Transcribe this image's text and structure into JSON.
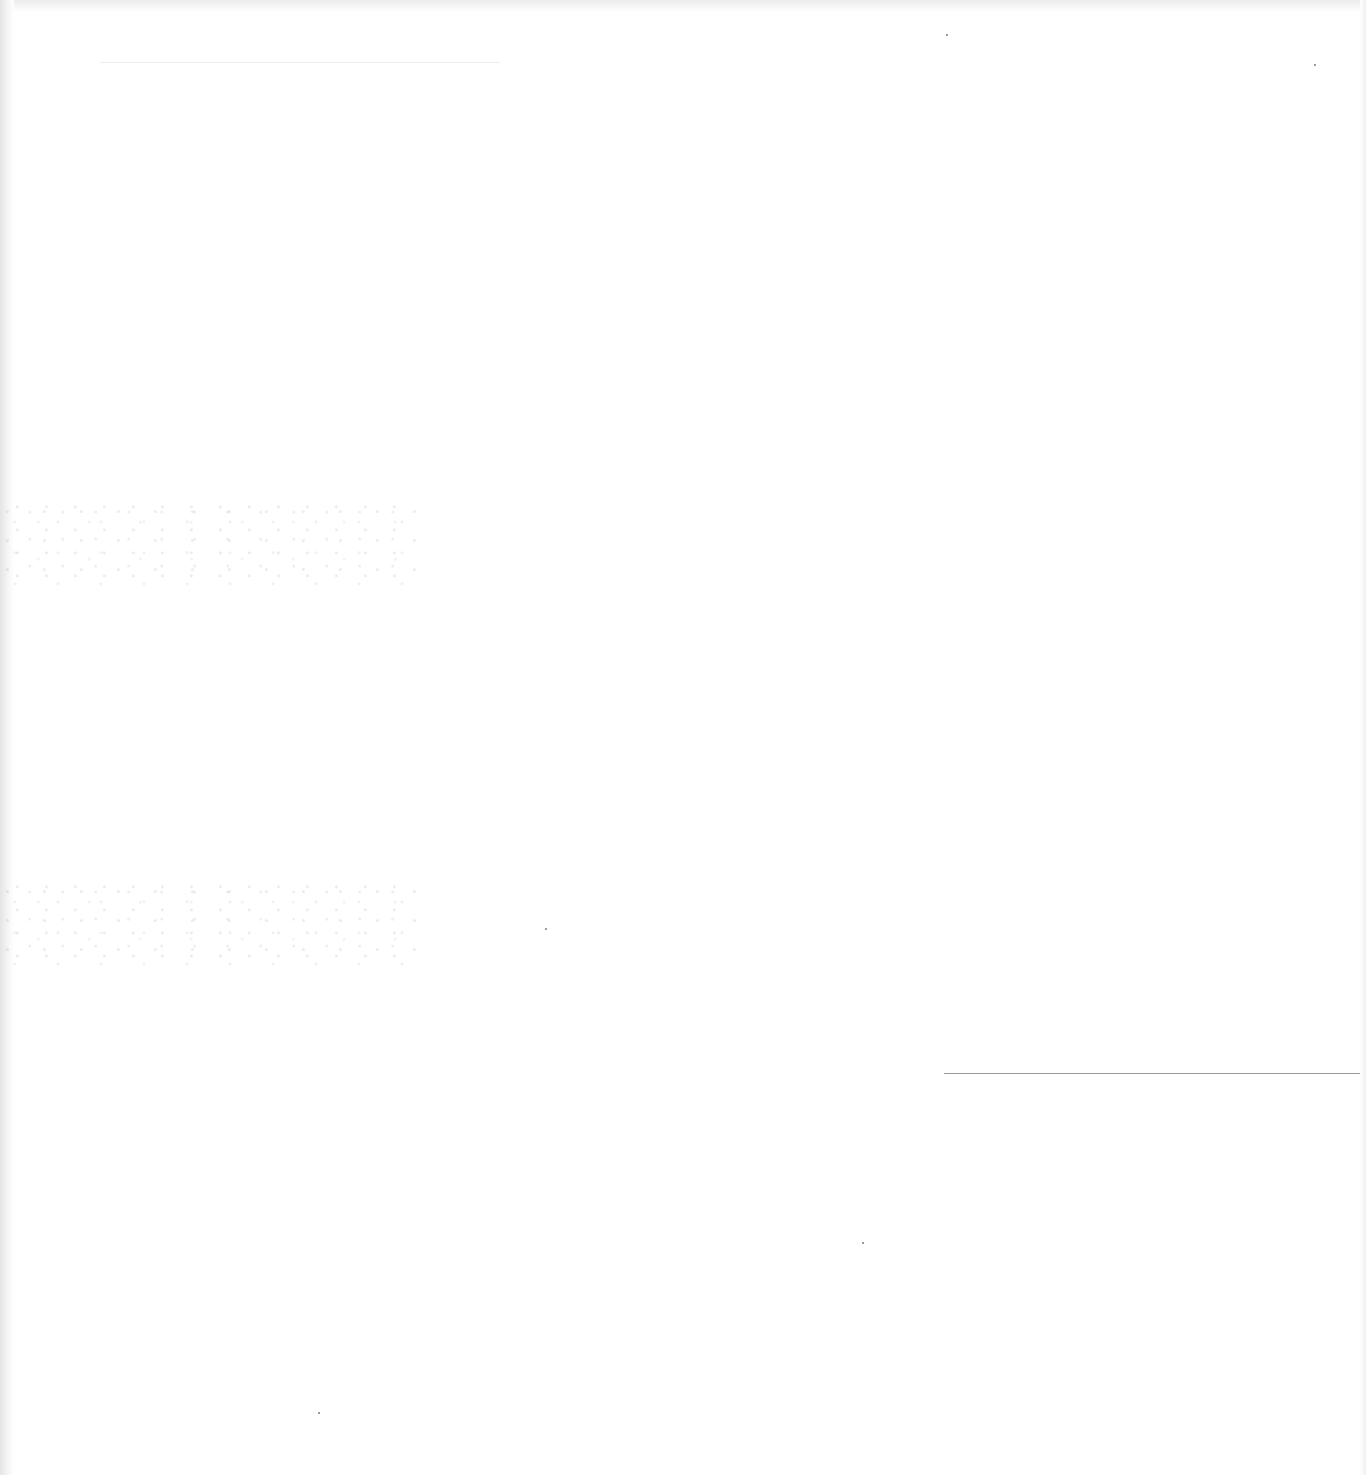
{
  "document": {
    "type": "blank scanned page",
    "text": "",
    "marks": {
      "horizontal_rule": {
        "x_start": 944,
        "x_end": 1360,
        "y": 1073,
        "color": "#9a9a9a"
      },
      "faint_top_line": {
        "x_start": 100,
        "x_end": 500,
        "y": 62,
        "color": "#ededed"
      }
    },
    "background_color": "#ffffff"
  }
}
